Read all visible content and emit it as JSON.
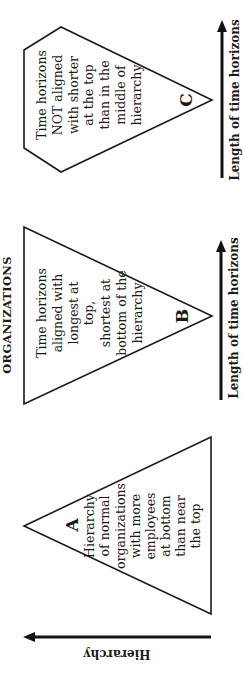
{
  "title": "ORGANIZATIONS",
  "colors": {
    "line": "#1a1a1a",
    "background": "#ffffff"
  },
  "shapes": {
    "a": {
      "letter": "A",
      "lines": [
        "Hierarchy",
        "of normal",
        "organizations",
        "with more",
        "employees",
        "at bottom",
        "than near",
        "the top"
      ]
    },
    "b": {
      "letter": "B",
      "lines": [
        "Time horizons",
        "aligned with",
        "longest at",
        "top,",
        "shortest at",
        "bottom of the",
        "hierarchy"
      ]
    },
    "c": {
      "letter": "C",
      "lines": [
        "Time horizons",
        "NOT aligned",
        "with shorter",
        "at the top",
        "than in the",
        "middle of",
        "hierarchy"
      ]
    }
  },
  "axes": {
    "hierarchy_label": "Hierarchy",
    "time_horizon_label_b": "Length of time horizons",
    "time_horizon_label_c": "Length of time horizons"
  }
}
